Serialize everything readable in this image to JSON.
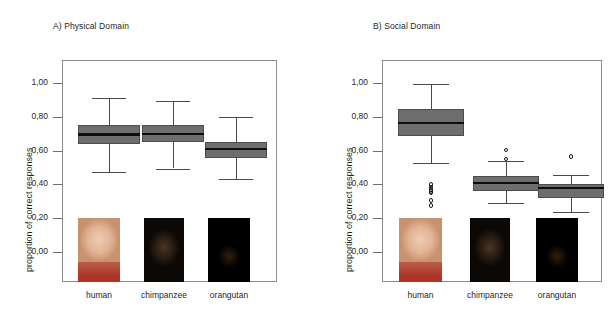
{
  "figure": {
    "panels": [
      {
        "id": "panel-a",
        "title": "A) Physical Domain",
        "ylabel": "proportion of correct responses"
      },
      {
        "id": "panel-b",
        "title": "B) Social Domain",
        "ylabel": "proportion of correct responses"
      }
    ],
    "tick_labels": [
      "1,00",
      "0,80",
      "0,60",
      "0,40",
      "0,20",
      "0,00"
    ],
    "categories": [
      "human",
      "chimpanzee",
      "orangutan"
    ],
    "photo_names": [
      "human-child-photo",
      "chimpanzee-photo",
      "orangutan-photo"
    ],
    "colors": {
      "box_fill": "#6e6e6e",
      "box_edge": "#4c4c4c",
      "median": "#0d0d0d",
      "whisker": "#4a4a4a",
      "frame": "#8e8e8e",
      "text": "#1f1f1f"
    }
  },
  "chart_data": [
    {
      "type": "box",
      "title": "A) Physical Domain",
      "xlabel": "",
      "ylabel": "proportion of correct responses",
      "ylim": [
        0.0,
        1.0
      ],
      "ytick_values": [
        1.0,
        0.8,
        0.6,
        0.4,
        0.2,
        0.0
      ],
      "ytick_labels": [
        "1,00",
        "0,80",
        "0,60",
        "0,40",
        "0,20",
        "0,00"
      ],
      "grid": false,
      "legend": "none",
      "categories": [
        "human",
        "chimpanzee",
        "orangutan"
      ],
      "boxes": [
        {
          "category": "human",
          "whisker_low": 0.48,
          "q1": 0.645,
          "median": 0.7,
          "q3": 0.755,
          "whisker_high": 0.92,
          "outliers": []
        },
        {
          "category": "chimpanzee",
          "whisker_low": 0.5,
          "q1": 0.655,
          "median": 0.705,
          "q3": 0.755,
          "whisker_high": 0.9,
          "outliers": []
        },
        {
          "category": "orangutan",
          "whisker_low": 0.435,
          "q1": 0.565,
          "median": 0.615,
          "q3": 0.655,
          "whisker_high": 0.805,
          "outliers": []
        }
      ]
    },
    {
      "type": "box",
      "title": "B) Social Domain",
      "xlabel": "",
      "ylabel": "proportion of correct responses",
      "ylim": [
        0.0,
        1.0
      ],
      "ytick_values": [
        1.0,
        0.8,
        0.6,
        0.4,
        0.2,
        0.0
      ],
      "ytick_labels": [
        "1,00",
        "0,80",
        "0,60",
        "0,40",
        "0,20",
        "0,00"
      ],
      "grid": false,
      "legend": "none",
      "categories": [
        "human",
        "chimpanzee",
        "orangutan"
      ],
      "boxes": [
        {
          "category": "human",
          "whisker_low": 0.535,
          "q1": 0.69,
          "median": 0.77,
          "q3": 0.855,
          "whisker_high": 1.0,
          "outliers": [
            0.405,
            0.39,
            0.375,
            0.365,
            0.355,
            0.31,
            0.28
          ]
        },
        {
          "category": "chimpanzee",
          "whisker_low": 0.295,
          "q1": 0.365,
          "median": 0.415,
          "q3": 0.455,
          "whisker_high": 0.545,
          "outliers": [
            0.61,
            0.555
          ]
        },
        {
          "category": "orangutan",
          "whisker_low": 0.24,
          "q1": 0.325,
          "median": 0.385,
          "q3": 0.41,
          "whisker_high": 0.46,
          "outliers": [
            0.57
          ]
        }
      ]
    }
  ]
}
